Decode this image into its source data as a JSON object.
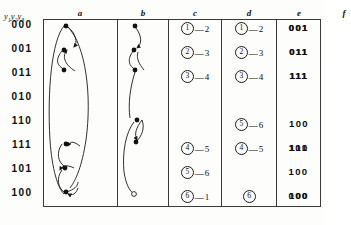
{
  "figure": {
    "row_variable_label": "y1y2y3",
    "row_variable_parts": {
      "y1": "y",
      "s1": "1",
      "y2": "y",
      "s2": "2",
      "y3": "y",
      "s3": "3"
    },
    "columns": [
      {
        "key": "a",
        "label": "a",
        "type": "diagram"
      },
      {
        "key": "b",
        "label": "b",
        "type": "diagram"
      },
      {
        "key": "c",
        "label": "c",
        "type": "pairs"
      },
      {
        "key": "d",
        "label": "d",
        "type": "pairs"
      },
      {
        "key": "e",
        "label": "e",
        "type": "binary"
      },
      {
        "key": "f",
        "label": "f",
        "type": "binary"
      }
    ],
    "rows": [
      {
        "label": "000"
      },
      {
        "label": "001"
      },
      {
        "label": "011"
      },
      {
        "label": "010"
      },
      {
        "label": "110"
      },
      {
        "label": "111"
      },
      {
        "label": "101"
      },
      {
        "label": "100"
      }
    ],
    "column_c": [
      {
        "circled": "1",
        "dash": "—",
        "target": "2"
      },
      {
        "circled": "2",
        "dash": "—",
        "target": "3"
      },
      {
        "circled": "3",
        "dash": "—",
        "target": "4"
      },
      null,
      null,
      {
        "circled": "4",
        "dash": "—",
        "target": "5"
      },
      {
        "circled": "5",
        "dash": "—",
        "target": "6"
      },
      {
        "circled": "6",
        "dash": "—",
        "target": "1"
      }
    ],
    "column_d": [
      {
        "circled": "1",
        "dash": "—",
        "target": "2"
      },
      {
        "circled": "2",
        "dash": "—",
        "target": "3"
      },
      {
        "circled": "3",
        "dash": "—",
        "target": "4"
      },
      null,
      {
        "circled": "5",
        "dash": "—",
        "target": "6"
      },
      {
        "circled": "4",
        "dash": "—",
        "target": "5"
      },
      null,
      {
        "circled": "6",
        "dash": "",
        "target": ""
      }
    ],
    "column_e": [
      "001",
      "011",
      "111",
      "",
      "",
      "101",
      "100",
      "000"
    ],
    "column_f": [
      "001",
      "011",
      "111",
      "",
      "100",
      "110",
      "",
      "100"
    ],
    "column_a_nodes": [
      {
        "row": 0,
        "filled": true
      },
      {
        "row": 1,
        "filled": true
      },
      {
        "row": 2,
        "filled": true
      },
      {
        "row": 5,
        "filled": true
      },
      {
        "row": 6,
        "filled": true
      },
      {
        "row": 7,
        "filled": true
      }
    ],
    "column_b_nodes": [
      {
        "row": 0,
        "filled": true
      },
      {
        "row": 1,
        "filled": true
      },
      {
        "row": 2,
        "filled": true
      },
      {
        "row": 4,
        "filled": true
      },
      {
        "row": 5,
        "filled": true
      },
      {
        "row": 7,
        "filled": false
      }
    ],
    "colors": {
      "ink": "#0d0d0d",
      "rule": "#3a3a3a",
      "paper": "#fdfdfb"
    }
  }
}
